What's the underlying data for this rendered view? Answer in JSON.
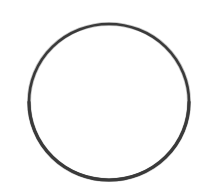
{
  "figure": {
    "kind": "line-drawing",
    "canvas": {
      "width": 210,
      "height": 194,
      "background_color": "#ffffff"
    },
    "shape": {
      "name": "circle",
      "center_x": 109,
      "center_y": 102,
      "radius": 79,
      "radius_x": 80,
      "radius_y": 78,
      "stroke_color": "#3a3a3a",
      "stroke_color_light": "#6d6d6d",
      "stroke_width": 2.6,
      "fill": "none",
      "bounds": {
        "left": 29,
        "top": 24,
        "right": 189,
        "bottom": 180
      }
    },
    "labels": [],
    "annotations": [],
    "text": []
  }
}
